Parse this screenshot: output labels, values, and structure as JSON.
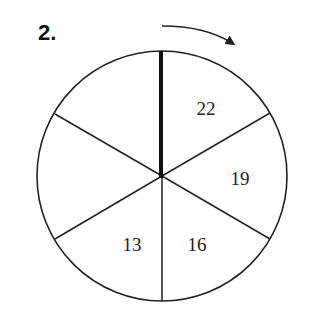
{
  "problem": {
    "number": "2."
  },
  "spinner": {
    "sections": 6,
    "center": [
      162,
      176
    ],
    "radius": 125,
    "pointer": "thick-vertical-line",
    "rotation_direction": "clockwise",
    "labels": [
      {
        "value": "22",
        "x": 206,
        "y": 115
      },
      {
        "value": "19",
        "x": 240,
        "y": 185
      },
      {
        "value": "16",
        "x": 197,
        "y": 251
      },
      {
        "value": "13",
        "x": 132,
        "y": 251
      },
      {
        "value": "",
        "x": 0,
        "y": 0
      },
      {
        "value": "",
        "x": 0,
        "y": 0
      }
    ]
  },
  "colors": {
    "stroke": "#222222",
    "background": "#ffffff"
  }
}
